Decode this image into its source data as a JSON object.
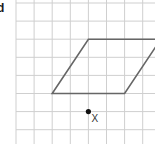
{
  "part_label": "d",
  "grid": {
    "origin_x": 16,
    "origin_y": 3,
    "cell_size": 18.1,
    "columns": 8,
    "rows": 8,
    "line_color": "#cfcfcf"
  },
  "shape": {
    "type": "parallelogram",
    "stroke_color": "#666666",
    "vertices_grid": [
      [
        2,
        5
      ],
      [
        4,
        2
      ],
      [
        8,
        2
      ],
      [
        6,
        5
      ]
    ]
  },
  "point": {
    "label": "X",
    "grid_x": 4,
    "grid_y": 6,
    "color": "#111111"
  }
}
